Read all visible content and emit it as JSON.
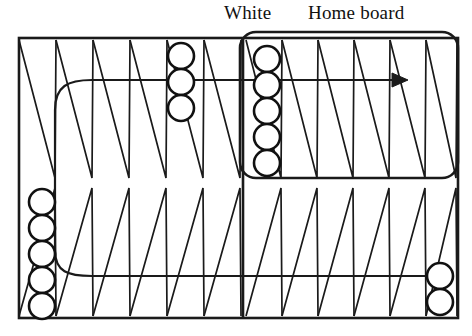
{
  "diagram": {
    "type": "backgammon-board",
    "title_labels": {
      "white": "White",
      "home_board": "Home board"
    },
    "colors": {
      "ink": "#1a1a1a",
      "background": "#ffffff",
      "checker_fill": "#ffffff",
      "checker_stroke": "#111111"
    },
    "board": {
      "outer_rect": {
        "x": 19,
        "y": 38,
        "width": 439,
        "height": 280
      },
      "bar_x": 243,
      "mid_y": 178,
      "quadrants": [
        {
          "name": "upper-left",
          "points": 6,
          "direction": "down"
        },
        {
          "name": "upper-right",
          "points": 6,
          "direction": "down"
        },
        {
          "name": "lower-left",
          "points": 6,
          "direction": "up"
        },
        {
          "name": "lower-right",
          "points": 6,
          "direction": "up"
        }
      ]
    },
    "home_board_highlight": {
      "x": 240,
      "y": 32,
      "width": 218,
      "height": 146,
      "radius": 16
    },
    "checker_stacks": [
      {
        "name": "upper-left-stack",
        "count": 3,
        "cx": 181,
        "top_y": 43,
        "r": 13,
        "spacing": 26
      },
      {
        "name": "home-board-stack",
        "count": 5,
        "cx": 267,
        "top_y": 46,
        "r": 13,
        "spacing": 26
      },
      {
        "name": "lower-left-stack",
        "count": 5,
        "cx": 42,
        "top_y": 189,
        "r": 13,
        "spacing": 26
      },
      {
        "name": "lower-right-stack",
        "count": 2,
        "cx": 440,
        "top_y": 263,
        "r": 13,
        "spacing": 26
      }
    ],
    "arrow": {
      "name": "movement-arrow",
      "from_x": 248,
      "to_x": 400,
      "y": 80,
      "head": "right"
    },
    "paths": [
      {
        "name": "upper-route-line",
        "description": "curve from lower-left bar area up and right along upper half"
      },
      {
        "name": "lower-route-line",
        "description": "curve from left checkers right along lower half to right checkers"
      }
    ]
  }
}
